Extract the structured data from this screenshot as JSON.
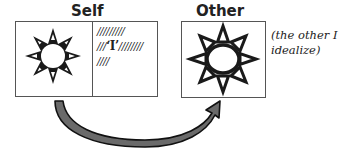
{
  "self": {
    "label": "Self",
    "hatch_lines": [
      "/////////",
      "///",
      "‘I’",
      "////////",
      "////"
    ]
  },
  "other": {
    "label": "Other",
    "note_line1": "(the other I",
    "note_line2": "idealize)"
  },
  "arrow": {
    "direction": "self-to-other",
    "color": "#555555"
  }
}
